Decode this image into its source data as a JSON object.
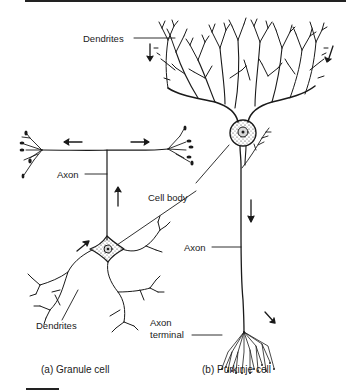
{
  "figure": {
    "labels": {
      "purkinje_dendrites": "Dendrites",
      "granule_axon": "Axon",
      "cell_body": "Cell body",
      "purkinje_axon": "Axon",
      "granule_dendrites": "Dendrites",
      "axon_terminal_line1": "Axon",
      "axon_terminal_line2": "terminal"
    },
    "captions": {
      "a": "(a) Granule cell",
      "b": "(b) Purkinje cell"
    },
    "colors": {
      "ink": "#1a1a1a",
      "soma_fill": "#e8e8e8",
      "background": "#ffffff"
    }
  }
}
